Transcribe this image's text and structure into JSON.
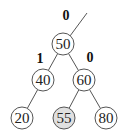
{
  "diagram": {
    "type": "binary-tree",
    "colors": {
      "stroke": "#555555",
      "node_fill": "#ffffff",
      "highlight_fill": "#e0e0e0",
      "text": "#222222"
    },
    "nodes": [
      {
        "id": "n50",
        "label": "50",
        "cx": 63,
        "cy": 44,
        "highlight": false
      },
      {
        "id": "n40",
        "label": "40",
        "cx": 43,
        "cy": 80,
        "highlight": false
      },
      {
        "id": "n60",
        "label": "60",
        "cx": 84,
        "cy": 80,
        "highlight": false
      },
      {
        "id": "n20",
        "label": "20",
        "cx": 22,
        "cy": 118,
        "highlight": false
      },
      {
        "id": "n55",
        "label": "55",
        "cx": 64,
        "cy": 118,
        "highlight": true
      },
      {
        "id": "n80",
        "label": "80",
        "cx": 106,
        "cy": 118,
        "highlight": false
      }
    ],
    "edges": [
      {
        "from": "n50",
        "to": "n40"
      },
      {
        "from": "n50",
        "to": "n60"
      },
      {
        "from": "n40",
        "to": "n20"
      },
      {
        "from": "n60",
        "to": "n55"
      },
      {
        "from": "n60",
        "to": "n80"
      }
    ],
    "parent_edge": {
      "x1": 70,
      "y1": 36,
      "x2": 87,
      "y2": 13
    },
    "balance_labels": [
      {
        "node": "n50",
        "text": "0",
        "x": 66,
        "y": 20
      },
      {
        "node": "n40",
        "text": "1",
        "x": 40,
        "y": 63
      },
      {
        "node": "n60",
        "text": "0",
        "x": 90,
        "y": 62
      }
    ],
    "node_radius": 11
  }
}
